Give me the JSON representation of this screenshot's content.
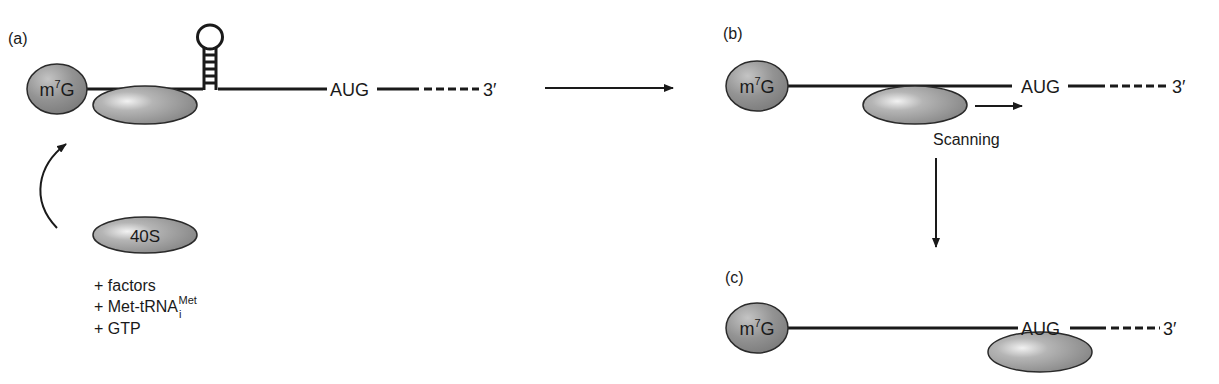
{
  "panels": {
    "a": {
      "label": "(a)",
      "cap": "m",
      "cap_sup": "7",
      "cap_tail": "G",
      "start_codon": "AUG",
      "three_prime": "3′",
      "free_subunit": "40S",
      "additions": [
        {
          "text": "+ factors",
          "sub": "",
          "sup": ""
        },
        {
          "text": "+ Met-tRNA",
          "sub": "i",
          "sup": "Met"
        },
        {
          "text": "+ GTP",
          "sub": "",
          "sup": ""
        }
      ]
    },
    "b": {
      "label": "(b)",
      "cap": "m",
      "cap_sup": "7",
      "cap_tail": "G",
      "start_codon": "AUG",
      "three_prime": "3′",
      "movement_label": "Scanning"
    },
    "c": {
      "label": "(c)",
      "cap": "m",
      "cap_sup": "7",
      "cap_tail": "G",
      "start_codon": "AUG",
      "three_prime": "3′"
    }
  },
  "colors": {
    "ink": "#1a1a1a",
    "shape_fill_dark": "#8a8a8a",
    "shape_fill_light": "#e8e8e8"
  }
}
